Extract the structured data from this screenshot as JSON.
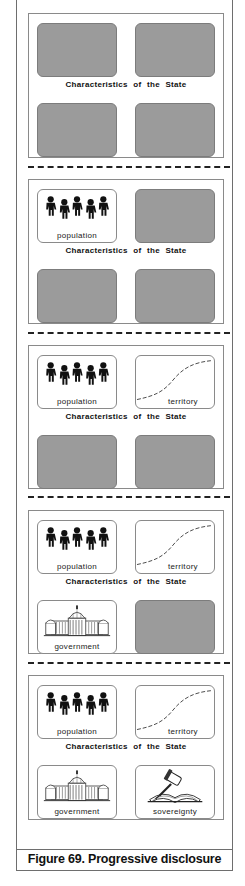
{
  "figure": {
    "caption": "Figure 69. Progressive disclosure",
    "panel_title": "Characteristics of the State"
  },
  "panels": [
    {
      "step": 1,
      "cells": [
        {
          "pos": "top-left",
          "state": "blank",
          "label": ""
        },
        {
          "pos": "top-right",
          "state": "blank",
          "label": ""
        },
        {
          "pos": "bottom-left",
          "state": "blank",
          "label": ""
        },
        {
          "pos": "bottom-right",
          "state": "blank",
          "label": ""
        }
      ]
    },
    {
      "step": 2,
      "cells": [
        {
          "pos": "top-left",
          "state": "revealed",
          "icon": "people-icon",
          "label": "population"
        },
        {
          "pos": "top-right",
          "state": "blank",
          "label": ""
        },
        {
          "pos": "bottom-left",
          "state": "blank",
          "label": ""
        },
        {
          "pos": "bottom-right",
          "state": "blank",
          "label": ""
        }
      ]
    },
    {
      "step": 3,
      "cells": [
        {
          "pos": "top-left",
          "state": "revealed",
          "icon": "people-icon",
          "label": "population"
        },
        {
          "pos": "top-right",
          "state": "revealed",
          "icon": "territory-curve-icon",
          "label": "territory"
        },
        {
          "pos": "bottom-left",
          "state": "blank",
          "label": ""
        },
        {
          "pos": "bottom-right",
          "state": "blank",
          "label": ""
        }
      ]
    },
    {
      "step": 4,
      "cells": [
        {
          "pos": "top-left",
          "state": "revealed",
          "icon": "people-icon",
          "label": "population"
        },
        {
          "pos": "top-right",
          "state": "revealed",
          "icon": "territory-curve-icon",
          "label": "territory"
        },
        {
          "pos": "bottom-left",
          "state": "revealed",
          "icon": "capitol-building-icon",
          "label": "government"
        },
        {
          "pos": "bottom-right",
          "state": "blank",
          "label": ""
        }
      ]
    },
    {
      "step": 5,
      "cells": [
        {
          "pos": "top-left",
          "state": "revealed",
          "icon": "people-icon",
          "label": "population"
        },
        {
          "pos": "top-right",
          "state": "revealed",
          "icon": "territory-curve-icon",
          "label": "territory"
        },
        {
          "pos": "bottom-left",
          "state": "revealed",
          "icon": "capitol-building-icon",
          "label": "government"
        },
        {
          "pos": "bottom-right",
          "state": "revealed",
          "icon": "gavel-book-icon",
          "label": "sovereignty"
        }
      ]
    }
  ],
  "colors": {
    "blank_cell": "#9b9b9b",
    "border": "#8a8a8a",
    "text": "#111111"
  }
}
